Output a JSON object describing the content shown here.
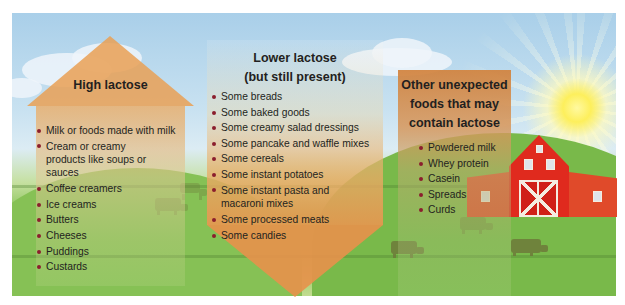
{
  "panels": {
    "high": {
      "title": "High lactose",
      "shape": "house",
      "items": [
        "Milk or foods made with milk",
        "Cream or creamy products like soups or sauces",
        "Coffee creamers",
        "Ice creams",
        "Butters",
        "Cheeses",
        "Puddings",
        "Custards"
      ]
    },
    "lower": {
      "title_line1": "Lower lactose",
      "title_line2": "(but still present)",
      "shape": "down-arrow",
      "items": [
        "Some breads",
        "Some baked goods",
        "Some creamy salad dressings",
        "Some pancake and waffle mixes",
        "Some cereals",
        "Some instant potatoes",
        "Some instant pasta and macaroni mixes",
        "Some processed meats",
        "Some candies"
      ]
    },
    "other": {
      "title_line1": "Other unexpected",
      "title_line2": "foods that may",
      "title_line3": "contain lactose",
      "shape": "rectangle",
      "items": [
        "Powdered milk",
        "Whey protein",
        "Casein",
        "Spreads",
        "Curds"
      ]
    }
  },
  "background": {
    "scene": "farm landscape with sky, clouds, sun, green hills, red barn, grazing cows",
    "icons": [
      "sun-icon",
      "barn-icon",
      "cow-icon",
      "cloud-icon"
    ]
  },
  "colors": {
    "panel_orange": "#e9a055",
    "bullet": "#8b1e2d",
    "text": "#231f20",
    "barn_red": "#e02a1e",
    "sky": "#a9cfe9",
    "grass": "#7fbf4c"
  }
}
